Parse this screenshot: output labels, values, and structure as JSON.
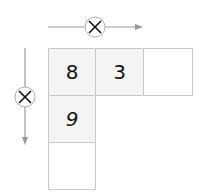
{
  "diagram": {
    "operation_symbol": "×",
    "grid": [
      [
        "8",
        "3",
        ""
      ],
      [
        "9",
        null,
        null
      ],
      [
        "",
        null,
        null
      ]
    ],
    "colors": {
      "line": "#9a9a9a",
      "cell_border": "#c8c8c8",
      "filled_bg": "#f4f4f4"
    }
  }
}
